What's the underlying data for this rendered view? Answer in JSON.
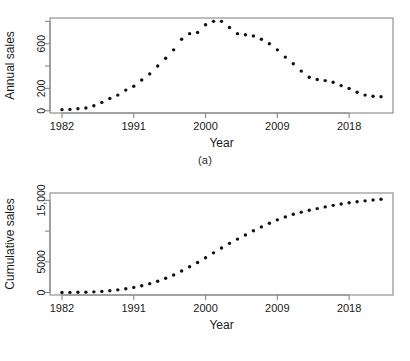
{
  "figure": {
    "background": "#ffffff",
    "point_color": "#111111",
    "axis_color": "#888888",
    "text_color": "#1a1a1a"
  },
  "panels": [
    {
      "id": "a",
      "caption": "(a)",
      "ylabel": "Annual sales",
      "xlabel": "Year"
    },
    {
      "id": "b",
      "caption": "(b)",
      "ylabel": "Cumulative sales",
      "xlabel": "Year"
    }
  ],
  "chart_data": [
    {
      "type": "scatter",
      "panel": "a",
      "title": "",
      "xlabel": "Year",
      "ylabel": "Annual sales",
      "xlim": [
        1980.5,
        2023.5
      ],
      "ylim": [
        -20,
        830
      ],
      "xticks": [
        1982,
        1991,
        2000,
        2009,
        2018
      ],
      "xtick_labels": [
        "1982",
        "1991",
        "2000",
        "2009",
        "2018"
      ],
      "yticks": [
        0,
        200,
        400,
        600,
        800
      ],
      "ytick_labels": [
        "0",
        "200",
        "",
        "600",
        ""
      ],
      "grid": false,
      "legend": false,
      "marker": "filled-circle",
      "x": [
        1982,
        1983,
        1984,
        1985,
        1986,
        1987,
        1988,
        1989,
        1990,
        1991,
        1992,
        1993,
        1994,
        1995,
        1996,
        1997,
        1998,
        1999,
        2000,
        2001,
        2002,
        2003,
        2004,
        2005,
        2006,
        2007,
        2008,
        2009,
        2010,
        2011,
        2012,
        2013,
        2014,
        2015,
        2016,
        2017,
        2018,
        2019,
        2020,
        2021,
        2022
      ],
      "y": [
        10,
        12,
        18,
        25,
        45,
        75,
        110,
        140,
        185,
        220,
        275,
        330,
        400,
        470,
        545,
        640,
        690,
        700,
        770,
        800,
        800,
        745,
        690,
        680,
        670,
        640,
        600,
        545,
        480,
        420,
        355,
        300,
        280,
        270,
        255,
        225,
        200,
        165,
        140,
        130,
        125
      ]
    },
    {
      "type": "scatter",
      "panel": "b",
      "title": "",
      "xlabel": "Year",
      "ylabel": "Cumulative sales",
      "xlim": [
        1980.5,
        2023.5
      ],
      "ylim": [
        -400,
        16200
      ],
      "xticks": [
        1982,
        1991,
        2000,
        2009,
        2018
      ],
      "xtick_labels": [
        "1982",
        "1991",
        "2000",
        "2009",
        "2018"
      ],
      "yticks": [
        0,
        5000,
        10000,
        15000
      ],
      "ytick_labels": [
        "0",
        "5000",
        "",
        "15,000"
      ],
      "grid": false,
      "legend": false,
      "marker": "filled-circle",
      "x": [
        1982,
        1983,
        1984,
        1985,
        1986,
        1987,
        1988,
        1989,
        1990,
        1991,
        1992,
        1993,
        1994,
        1995,
        1996,
        1997,
        1998,
        1999,
        2000,
        2001,
        2002,
        2003,
        2004,
        2005,
        2006,
        2007,
        2008,
        2009,
        2010,
        2011,
        2012,
        2013,
        2014,
        2015,
        2016,
        2017,
        2018,
        2019,
        2020,
        2021,
        2022
      ],
      "y": [
        10,
        22,
        40,
        65,
        110,
        185,
        295,
        435,
        620,
        840,
        1115,
        1445,
        1845,
        2315,
        2860,
        3500,
        4190,
        4890,
        5660,
        6460,
        7260,
        8005,
        8695,
        9375,
        10045,
        10685,
        11285,
        11830,
        12310,
        12730,
        13085,
        13385,
        13665,
        13935,
        14190,
        14415,
        14615,
        14780,
        14920,
        15050,
        15175
      ]
    }
  ]
}
